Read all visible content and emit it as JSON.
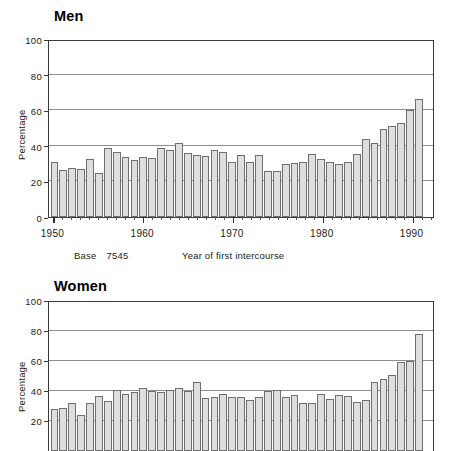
{
  "figure": {
    "panels": [
      "Men",
      "Women"
    ]
  },
  "men": {
    "title": "Men",
    "ylabel": "Percentage",
    "xlabel": "Year of first intercourse",
    "base_label": "Base",
    "base_value": "7545",
    "yticks": [
      "100",
      "80",
      "60",
      "40",
      "20",
      "0"
    ],
    "xticks": [
      "1950",
      "1960",
      "1970",
      "1980",
      "1990"
    ]
  },
  "women": {
    "title": "Women",
    "ylabel": "Percentage",
    "yticks": [
      "100",
      "80",
      "60",
      "40",
      "20"
    ]
  },
  "colors": {
    "bar_fill": "#dedede",
    "bar_stroke": "#6f6f6f",
    "axis": "#3a3a3a",
    "gridline": "#8e8e8e",
    "text": "#1a1a1a"
  },
  "chart_data": [
    {
      "type": "bar",
      "title": "Men",
      "xlabel": "Year of first intercourse",
      "ylabel": "Percentage",
      "ylim": [
        0,
        100
      ],
      "yticks": [
        0,
        20,
        40,
        60,
        80,
        100
      ],
      "grid": true,
      "legend": "none",
      "annotations": [
        "Base 7545"
      ],
      "categories": [
        1950,
        1951,
        1952,
        1953,
        1954,
        1955,
        1956,
        1957,
        1958,
        1959,
        1960,
        1961,
        1962,
        1963,
        1964,
        1965,
        1966,
        1967,
        1968,
        1969,
        1970,
        1971,
        1972,
        1973,
        1974,
        1975,
        1976,
        1977,
        1978,
        1979,
        1980,
        1981,
        1982,
        1983,
        1984,
        1985,
        1986,
        1987,
        1988,
        1989,
        1990,
        1991,
        1992
      ],
      "values": [
        31.5,
        26.5,
        28,
        27.5,
        33,
        25,
        39,
        37,
        34,
        32.5,
        34,
        33.5,
        39,
        38,
        42,
        36.5,
        35,
        34.5,
        38,
        37,
        31,
        35.5,
        31.5,
        35,
        26,
        26,
        30,
        30.5,
        31,
        36,
        33,
        31.5,
        30,
        31.5,
        36,
        44.5,
        42,
        50,
        51.5,
        53.5,
        61,
        67,
        0
      ]
    },
    {
      "type": "bar",
      "title": "Women",
      "ylabel": "Percentage",
      "ylim": [
        0,
        100
      ],
      "yticks": [
        20,
        40,
        60,
        80,
        100
      ],
      "grid": true,
      "legend": "none",
      "categories": [
        1950,
        1951,
        1952,
        1953,
        1954,
        1955,
        1956,
        1957,
        1958,
        1959,
        1960,
        1961,
        1962,
        1963,
        1964,
        1965,
        1966,
        1967,
        1968,
        1969,
        1970,
        1971,
        1972,
        1973,
        1974,
        1975,
        1976,
        1977,
        1978,
        1979,
        1980,
        1981,
        1982,
        1983,
        1984,
        1985,
        1986,
        1987,
        1988,
        1989,
        1990,
        1991,
        1992
      ],
      "values": [
        28.5,
        29,
        32,
        24.5,
        32,
        37,
        33.5,
        41,
        38,
        39.5,
        42.5,
        40.5,
        39.5,
        41,
        42,
        40,
        46.5,
        35.5,
        36.5,
        38.5,
        36,
        36.5,
        34,
        36.5,
        40.5,
        41,
        36,
        37.5,
        32,
        32,
        38.5,
        35,
        37.5,
        37,
        33,
        34.5,
        46,
        48.5,
        51,
        59.5,
        60.5,
        78.5,
        0
      ]
    }
  ]
}
